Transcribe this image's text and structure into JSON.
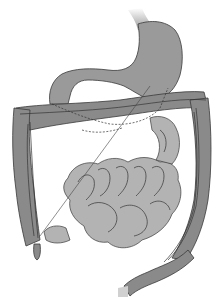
{
  "figure": {
    "palette": {
      "background": "#ffffff",
      "colon": "#8a8a8a",
      "stomach": "#9a9a9a",
      "small_intestine": "#b3b3b3",
      "outline": "#3a3a3a",
      "esophagus_highlight": "#c8c8c8"
    },
    "parts": [
      "esophagus",
      "stomach",
      "transverse-colon",
      "ascending-colon",
      "descending-colon",
      "sigmoid-colon",
      "small-intestine",
      "appendix",
      "pointer-line"
    ]
  }
}
